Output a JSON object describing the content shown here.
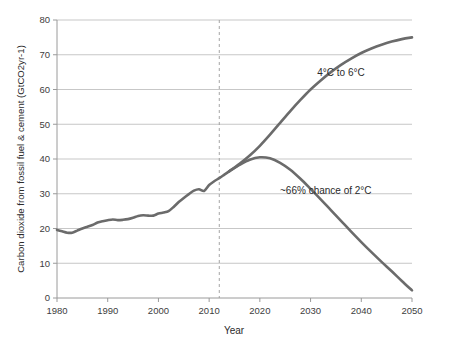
{
  "chart_data": {
    "type": "line",
    "title": "",
    "subtitle": "",
    "xlabel": "Year",
    "ylabel": "Carbon dioxide from fossil fuel & cement (GtCO2yr-1)",
    "xlim": [
      1980,
      2050
    ],
    "ylim": [
      0,
      80
    ],
    "grid": true,
    "grid_axis": "y",
    "legend": "none",
    "x_ticks": [
      "1980",
      "1990",
      "2000",
      "2010",
      "2020",
      "2030",
      "2040",
      "2050"
    ],
    "x_tick_values": [
      1980,
      1990,
      2000,
      2010,
      2020,
      2030,
      2040,
      2050
    ],
    "y_ticks": [
      "0",
      "10",
      "20",
      "30",
      "40",
      "50",
      "60",
      "70",
      "80"
    ],
    "y_tick_values": [
      0,
      10,
      20,
      30,
      40,
      50,
      60,
      70,
      80
    ],
    "series": [
      {
        "name": "Historical emissions",
        "color": "#6b6b6b",
        "x": [
          1980,
          1981,
          1982,
          1983,
          1984,
          1985,
          1986,
          1987,
          1988,
          1989,
          1990,
          1991,
          1992,
          1993,
          1994,
          1995,
          1996,
          1997,
          1998,
          1999,
          2000,
          2001,
          2002,
          2003,
          2004,
          2005,
          2006,
          2007,
          2008,
          2009,
          2010,
          2011,
          2012,
          2013,
          2014
        ],
        "values": [
          19.6,
          19.2,
          18.8,
          18.8,
          19.4,
          20.0,
          20.5,
          21.0,
          21.7,
          22.1,
          22.4,
          22.6,
          22.4,
          22.5,
          22.7,
          23.1,
          23.6,
          23.8,
          23.7,
          23.7,
          24.3,
          24.6,
          25.0,
          26.2,
          27.6,
          28.8,
          29.9,
          30.9,
          31.3,
          30.8,
          32.5,
          33.6,
          34.5,
          35.5,
          36.5
        ],
        "style": "solid"
      },
      {
        "name": "4°C to 6°C",
        "color": "#6b6b6b",
        "x": [
          2014,
          2016,
          2018,
          2020,
          2022,
          2024,
          2026,
          2028,
          2030,
          2032,
          2034,
          2036,
          2038,
          2040,
          2042,
          2044,
          2046,
          2048,
          2050
        ],
        "values": [
          36.5,
          38.6,
          41.0,
          43.8,
          47.0,
          50.4,
          53.8,
          57.0,
          60.0,
          62.6,
          65.0,
          67.1,
          68.9,
          70.5,
          71.8,
          72.9,
          73.8,
          74.5,
          75.0
        ],
        "style": "solid"
      },
      {
        "name": "~66% chance of 2°C",
        "color": "#6b6b6b",
        "x": [
          2014,
          2016,
          2018,
          2020,
          2022,
          2024,
          2026,
          2028,
          2030,
          2032,
          2034,
          2036,
          2038,
          2040,
          2042,
          2044,
          2046,
          2048,
          2050
        ],
        "values": [
          36.5,
          38.3,
          39.8,
          40.5,
          40.2,
          38.9,
          36.9,
          34.3,
          31.4,
          28.4,
          25.3,
          22.2,
          19.1,
          16.1,
          13.2,
          10.4,
          7.7,
          4.9,
          2.2
        ],
        "style": "solid"
      }
    ],
    "annotations": [
      {
        "id": "upper-scenario-label",
        "text": "4°C to 6°C",
        "x": 2036,
        "y": 64
      },
      {
        "id": "lower-scenario-label",
        "text": "~66% chance of 2°C",
        "x": 2033,
        "y": 30
      }
    ],
    "reference_lines": [
      {
        "id": "present-year-divider",
        "orientation": "vertical",
        "x": 2012,
        "style": "dashed"
      }
    ]
  }
}
